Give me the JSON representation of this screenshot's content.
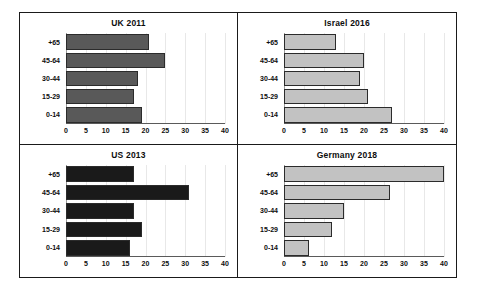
{
  "figure": {
    "name": "population-age-structure-panels"
  },
  "chart_data": [
    {
      "type": "bar",
      "orientation": "horizontal",
      "title": "UK 2011",
      "categories": [
        "+65",
        "45-64",
        "30-44",
        "15-29",
        "0-14"
      ],
      "values": [
        21,
        25,
        18,
        17,
        19
      ],
      "xlabel": "",
      "ylabel": "",
      "xlim": [
        0,
        40
      ],
      "xticks": [
        0,
        5,
        10,
        15,
        20,
        25,
        30,
        35,
        40
      ],
      "bar_color": "#595959",
      "grid": true,
      "legend": false
    },
    {
      "type": "bar",
      "orientation": "horizontal",
      "title": "Israel 2016",
      "categories": [
        "+65",
        "45-64",
        "30-44",
        "15-29",
        "0-14"
      ],
      "values": [
        13,
        20,
        19,
        21,
        27
      ],
      "xlabel": "",
      "ylabel": "",
      "xlim": [
        0,
        40
      ],
      "xticks": [
        0,
        5,
        10,
        15,
        20,
        25,
        30,
        35,
        40
      ],
      "bar_color": "#c2c2c2",
      "grid": true,
      "legend": false
    },
    {
      "type": "bar",
      "orientation": "horizontal",
      "title": "US 2013",
      "categories": [
        "+65",
        "45-64",
        "30-44",
        "15-29",
        "0-14"
      ],
      "values": [
        17,
        31,
        17,
        19,
        16
      ],
      "xlabel": "",
      "ylabel": "",
      "xlim": [
        0,
        40
      ],
      "xticks": [
        0,
        5,
        10,
        15,
        20,
        25,
        30,
        35,
        40
      ],
      "bar_color": "#1a1a1a",
      "grid": true,
      "legend": false
    },
    {
      "type": "bar",
      "orientation": "horizontal",
      "title": "Germany 2018",
      "categories": [
        "+65",
        "45-64",
        "30-44",
        "15-29",
        "0-14"
      ],
      "values": [
        40,
        26.5,
        15,
        12,
        6.3
      ],
      "xlabel": "",
      "ylabel": "",
      "xlim": [
        0,
        40
      ],
      "xticks": [
        0,
        5,
        10,
        15,
        20,
        25,
        30,
        35,
        40
      ],
      "bar_color": "#c2c2c2",
      "grid": true,
      "legend": false
    }
  ]
}
